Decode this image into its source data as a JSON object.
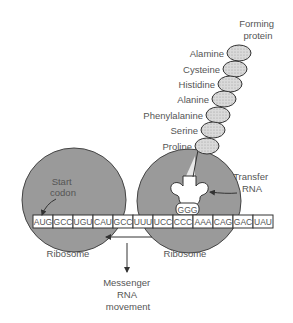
{
  "diagram": {
    "title_label": [
      "Forming",
      "protein"
    ],
    "amino_acids": [
      {
        "label": "Alamine"
      },
      {
        "label": "Cysteine"
      },
      {
        "label": "Histidine"
      },
      {
        "label": "Alanine"
      },
      {
        "label": "Phenylalanine"
      },
      {
        "label": "Serine"
      },
      {
        "label": "Proline"
      }
    ],
    "start_codon_label": [
      "Start",
      "codon"
    ],
    "transfer_rna_label": [
      "Transfer",
      "RNA"
    ],
    "anticodon": "GGG",
    "codons": [
      "AUG",
      "GCC",
      "UGU",
      "CAU",
      "GCC",
      "UUU",
      "UCC",
      "CCC",
      "AAA",
      "CAG",
      "GAC",
      "UAU"
    ],
    "ribosome_left_label": "Ribosome",
    "ribosome_right_label": "Ribosome",
    "movement_label": [
      "Messenger",
      "RNA",
      "movement"
    ],
    "colors": {
      "ribosome_fill": "#9a9a9a",
      "oval_fill": "#cfcfcf",
      "outline": "#333333",
      "text": "#555555"
    }
  }
}
